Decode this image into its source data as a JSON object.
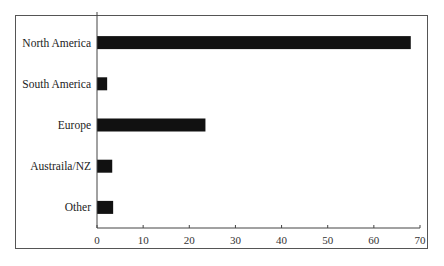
{
  "chart_data": {
    "type": "bar",
    "orientation": "horizontal",
    "title": "",
    "xlabel": "",
    "ylabel": "",
    "categories": [
      "North America",
      "South America",
      "Europe",
      "Austraila/NZ",
      "Other"
    ],
    "values": [
      68,
      2.2,
      23.5,
      3.3,
      3.5
    ],
    "xlim": [
      0,
      70
    ],
    "xticks": [
      0,
      10,
      20,
      30,
      40,
      50,
      60,
      70
    ],
    "grid": false,
    "legend": "none",
    "bar_color": "#111111"
  }
}
